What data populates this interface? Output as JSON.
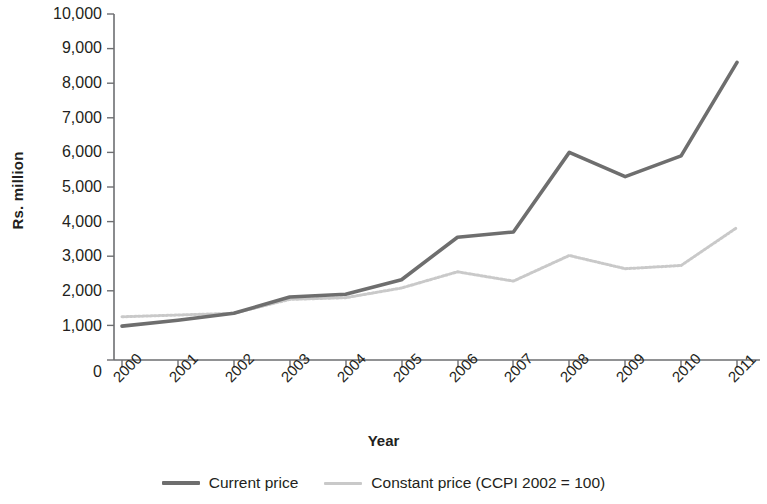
{
  "chart_data": {
    "type": "line",
    "title": "",
    "xlabel": "Year",
    "ylabel": "Rs. million",
    "categories": [
      "2000",
      "2001",
      "2002",
      "2003",
      "2004",
      "2005",
      "2006",
      "2007",
      "2008",
      "2009",
      "2010",
      "2011"
    ],
    "x": [
      2000,
      2001,
      2002,
      2003,
      2004,
      2005,
      2006,
      2007,
      2008,
      2009,
      2010,
      2011
    ],
    "series": [
      {
        "name": "Current price",
        "color": "#6e6e6e",
        "style": "solid",
        "values": [
          980,
          1150,
          1350,
          1820,
          1900,
          2320,
          3550,
          3700,
          6000,
          5300,
          5900,
          8600
        ]
      },
      {
        "name": "Constant price (CCPI 2002 = 100)",
        "color": "#c9c9c9",
        "style": "dotted",
        "values": [
          1250,
          1300,
          1350,
          1750,
          1800,
          2080,
          2550,
          2280,
          3020,
          2640,
          2730,
          3830
        ]
      }
    ],
    "ylim": [
      0,
      10000
    ],
    "ytick_values": [
      0,
      1000,
      2000,
      3000,
      4000,
      5000,
      6000,
      7000,
      8000,
      9000,
      10000
    ],
    "ytick_labels": [
      "0",
      "1,000",
      "2,000",
      "3,000",
      "4,000",
      "5,000",
      "6,000",
      "7,000",
      "8,000",
      "9,000",
      "10,000"
    ],
    "xtick_labels": [
      "2000",
      "2001",
      "2002",
      "2003",
      "2004",
      "2005",
      "2006",
      "2007",
      "2008",
      "2009",
      "2010",
      "2011"
    ],
    "grid": false,
    "legend_position": "bottom",
    "xtick_rotation": -45
  },
  "axes": {
    "y_title": "Rs. million",
    "x_title": "Year"
  },
  "legend": {
    "items": [
      {
        "label": "Current price",
        "color": "#6e6e6e"
      },
      {
        "label": "Constant price (CCPI 2002 = 100)",
        "color": "#c9c9c9"
      }
    ]
  },
  "colors": {
    "current_price": "#6e6e6e",
    "constant_price": "#c9c9c9",
    "axis": "#6d6e71",
    "text": "#231f20",
    "background": "#ffffff"
  }
}
